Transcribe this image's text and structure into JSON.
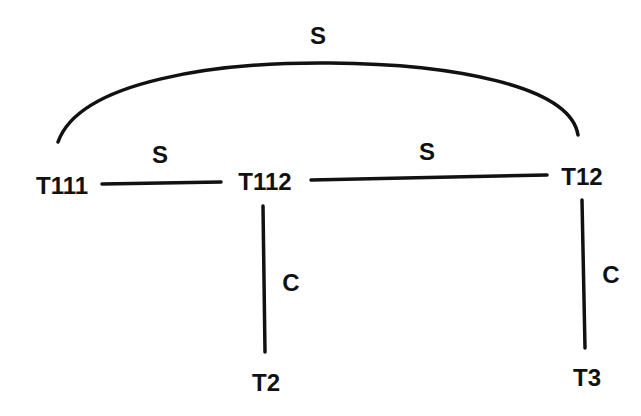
{
  "diagram": {
    "type": "graph",
    "background": "#ffffff",
    "stroke_color": "#111111",
    "nodes": [
      {
        "id": "T111",
        "label": "T111",
        "x": 62,
        "y": 186
      },
      {
        "id": "T112",
        "label": "T112",
        "x": 265,
        "y": 182
      },
      {
        "id": "T12",
        "label": "T12",
        "x": 582,
        "y": 176
      },
      {
        "id": "T2",
        "label": "T2",
        "x": 265,
        "y": 382
      },
      {
        "id": "T3",
        "label": "T3",
        "x": 586,
        "y": 378
      }
    ],
    "edges": [
      {
        "from": "T111",
        "to": "T12",
        "label": "S",
        "shape": "arc"
      },
      {
        "from": "T111",
        "to": "T112",
        "label": "S",
        "shape": "line"
      },
      {
        "from": "T112",
        "to": "T12",
        "label": "S",
        "shape": "line"
      },
      {
        "from": "T112",
        "to": "T2",
        "label": "C",
        "shape": "line"
      },
      {
        "from": "T12",
        "to": "T3",
        "label": "C",
        "shape": "line"
      }
    ]
  }
}
